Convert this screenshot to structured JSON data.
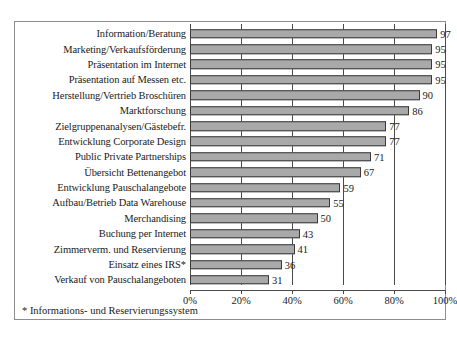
{
  "chart_data": {
    "type": "bar",
    "orientation": "horizontal",
    "title": "",
    "subtitle": "",
    "xlabel": "",
    "ylabel": "",
    "xlim": [
      0,
      100
    ],
    "xticks": [
      0,
      20,
      40,
      60,
      80,
      100
    ],
    "xtick_labels": [
      "0%",
      "20%",
      "40%",
      "60%",
      "80%",
      "100%"
    ],
    "grid": true,
    "legend": false,
    "bar_color": "#a9a9a9",
    "bar_border_color": "#3a3a3a",
    "categories": [
      "Information/Beratung",
      "Marketing/Verkaufsförderung",
      "Präsentation im Internet",
      "Präsentation auf Messen etc.",
      "Herstellung/Vertrieb Broschüren",
      "Marktforschung",
      "Zielgruppenanalysen/Gästebefr.",
      "Entwicklung Corporate Design",
      "Public Private Partnerships",
      "Übersicht Bettenangebot",
      "Entwicklung Pauschalangebote",
      "Aufbau/Betrieb Data Warehouse",
      "Merchandising",
      "Buchung per Internet",
      "Zimmerverm. und Reservierung",
      "Einsatz eines IRS*",
      "Verkauf von Pauschalangeboten"
    ],
    "values": [
      97,
      95,
      95,
      95,
      90,
      86,
      77,
      77,
      71,
      67,
      59,
      55,
      50,
      43,
      41,
      36,
      31
    ],
    "value_labels": [
      "97",
      "95",
      "95",
      "95",
      "90",
      "86",
      "77",
      "77",
      "71",
      "67",
      "59",
      "55",
      "50",
      "43",
      "41",
      "36",
      "31"
    ],
    "annotations": [
      "* Informations- und Reservierungssystem"
    ]
  },
  "footnote": {
    "marker": "*",
    "text": " Informations- und Reservierungssystem"
  }
}
